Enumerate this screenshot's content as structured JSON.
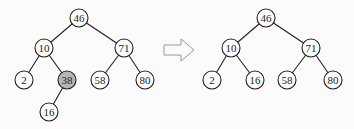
{
  "colors": {
    "edge": "#222222",
    "node_fill": "#ffffff",
    "highlight_fill": "#b5b5b5",
    "arrow_stroke": "#9a9a9a"
  },
  "before_tree": {
    "nodes": [
      {
        "id": "b46",
        "label": "46",
        "x": 79,
        "y": 18,
        "highlight": false
      },
      {
        "id": "b10",
        "label": "10",
        "x": 44,
        "y": 48,
        "highlight": false
      },
      {
        "id": "b71",
        "label": "71",
        "x": 124,
        "y": 48,
        "highlight": false
      },
      {
        "id": "b2",
        "label": "2",
        "x": 24,
        "y": 80,
        "highlight": false
      },
      {
        "id": "b38",
        "label": "38",
        "x": 67,
        "y": 80,
        "highlight": true
      },
      {
        "id": "b58",
        "label": "58",
        "x": 100,
        "y": 80,
        "highlight": false
      },
      {
        "id": "b80",
        "label": "80",
        "x": 145,
        "y": 80,
        "highlight": false
      },
      {
        "id": "b16",
        "label": "16",
        "x": 49,
        "y": 112,
        "highlight": false
      }
    ],
    "edges": [
      [
        "b46",
        "b10"
      ],
      [
        "b46",
        "b71"
      ],
      [
        "b10",
        "b2"
      ],
      [
        "b10",
        "b38"
      ],
      [
        "b71",
        "b58"
      ],
      [
        "b71",
        "b80"
      ],
      [
        "b38",
        "b16"
      ]
    ]
  },
  "arrow": {
    "direction": "right",
    "icon": "hollow-right-arrow-icon"
  },
  "after_tree": {
    "nodes": [
      {
        "id": "a46",
        "label": "46",
        "x": 266,
        "y": 18,
        "highlight": false
      },
      {
        "id": "a10",
        "label": "10",
        "x": 231,
        "y": 48,
        "highlight": false
      },
      {
        "id": "a71",
        "label": "71",
        "x": 311,
        "y": 48,
        "highlight": false
      },
      {
        "id": "a2",
        "label": "2",
        "x": 212,
        "y": 80,
        "highlight": false
      },
      {
        "id": "a16",
        "label": "16",
        "x": 255,
        "y": 80,
        "highlight": false
      },
      {
        "id": "a58",
        "label": "58",
        "x": 287,
        "y": 80,
        "highlight": false
      },
      {
        "id": "a80",
        "label": "80",
        "x": 333,
        "y": 80,
        "highlight": false
      }
    ],
    "edges": [
      [
        "a46",
        "a10"
      ],
      [
        "a46",
        "a71"
      ],
      [
        "a10",
        "a2"
      ],
      [
        "a10",
        "a16"
      ],
      [
        "a71",
        "a58"
      ],
      [
        "a71",
        "a80"
      ]
    ]
  }
}
